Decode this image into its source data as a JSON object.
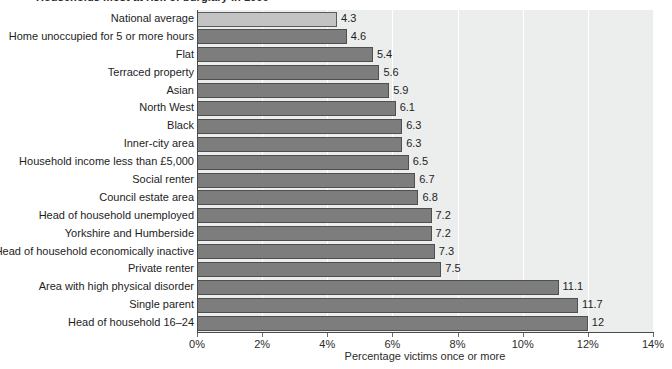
{
  "chart_data": {
    "type": "bar",
    "orientation": "horizontal",
    "title": "Households most at risk of burglary in 1999",
    "xlabel": "Percentage victims once or more",
    "ylabel": "",
    "xlim": [
      0,
      14
    ],
    "xtick_labels": [
      "0%",
      "2%",
      "4%",
      "6%",
      "8%",
      "10%",
      "12%",
      "14%"
    ],
    "xtick_values": [
      0,
      2,
      4,
      6,
      8,
      10,
      12,
      14
    ],
    "grid": true,
    "legend": "none",
    "categories": [
      "National average",
      "Home unoccupied for 5 or more hours",
      "Flat",
      "Terraced property",
      "Asian",
      "North West",
      "Black",
      "Inner-city area",
      "Household income less than £5,000",
      "Social renter",
      "Council estate area",
      "Head of household unemployed",
      "Yorkshire and Humberside",
      "Head of household economically inactive",
      "Private renter",
      "Area with high physical disorder",
      "Single parent",
      "Head of household 16–24"
    ],
    "values": [
      4.3,
      4.6,
      5.4,
      5.6,
      5.9,
      6.1,
      6.3,
      6.3,
      6.5,
      6.7,
      6.8,
      7.2,
      7.2,
      7.3,
      7.5,
      11.1,
      11.7,
      12
    ],
    "value_labels": [
      "4.3",
      "4.6",
      "5.4",
      "5.6",
      "5.9",
      "6.1",
      "6.3",
      "6.3",
      "6.5",
      "6.7",
      "6.8",
      "7.2",
      "7.2",
      "7.3",
      "7.5",
      "11.1",
      "11.7",
      "12"
    ],
    "highlight_index": 0,
    "colors": {
      "bar": "#7d7d7d",
      "bar_highlight": "#c3c3c3",
      "bar_border": "#4f4f4f",
      "plot_background": "#eceded",
      "gridline": "#ffffff",
      "axis": "#4a4a4a",
      "text": "#1d1d1d"
    }
  }
}
